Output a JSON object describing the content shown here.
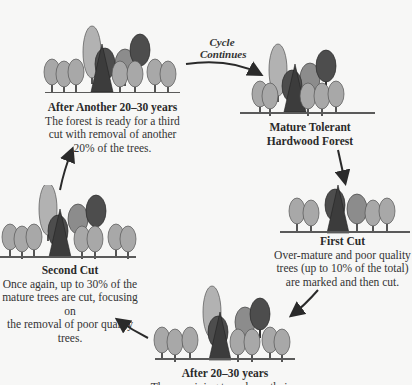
{
  "diagram": {
    "type": "cycle",
    "cycle_label": {
      "line1": "Cycle",
      "line2": "Continues"
    },
    "stages": [
      {
        "id": "mature",
        "title_line1": "Mature Tolerant",
        "title_line2": "Hardwood Forest",
        "description": []
      },
      {
        "id": "first-cut",
        "title": "First Cut",
        "description": [
          "Over-mature and poor quality",
          "trees (up to 10% of the total)",
          "are marked and then cut."
        ]
      },
      {
        "id": "after-20-30",
        "title": "After 20–30 years",
        "description": [
          "The remaining trees have their..."
        ]
      },
      {
        "id": "second-cut",
        "title": "Second Cut",
        "description": [
          "Once again, up to 30% of the",
          "mature trees are cut, focusing on",
          "the removal of poor quality trees."
        ]
      },
      {
        "id": "after-another",
        "title": "After Another 20–30 years",
        "description": [
          "The forest is ready for a third",
          "cut with removal of another",
          "20% of the trees."
        ]
      }
    ],
    "colors": {
      "ground": "#5a5a5a",
      "tree_light": "#a9a9a9",
      "tree_mid": "#8a8a8a",
      "tree_dark": "#4a4a4a",
      "background": "#f7f7f6"
    }
  }
}
